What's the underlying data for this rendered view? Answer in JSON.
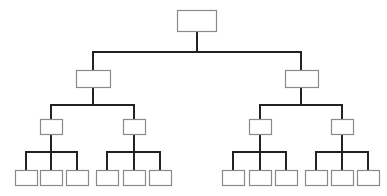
{
  "diagram": {
    "type": "hierarchy-tree",
    "levels": 4,
    "colors": {
      "line": "#222222",
      "box_border": "#8a8a8a",
      "box_fill": "#ffffff",
      "background": "#ffffff"
    },
    "nodes": [
      {
        "id": "root",
        "level": 0,
        "label": "",
        "x": 177,
        "y": 10,
        "w": 39,
        "h": 21,
        "cx": 197
      },
      {
        "id": "L1",
        "level": 1,
        "label": "",
        "parent": "root",
        "x": 76,
        "y": 70,
        "w": 34,
        "h": 17,
        "cx": 93
      },
      {
        "id": "R1",
        "level": 1,
        "label": "",
        "parent": "root",
        "x": 285,
        "y": 70,
        "w": 33,
        "h": 17,
        "cx": 301
      },
      {
        "id": "LL2",
        "level": 2,
        "label": "",
        "parent": "L1",
        "x": 40,
        "y": 119,
        "w": 22,
        "h": 15,
        "cx": 51
      },
      {
        "id": "LR2",
        "level": 2,
        "label": "",
        "parent": "L1",
        "x": 123,
        "y": 119,
        "w": 22,
        "h": 15,
        "cx": 134
      },
      {
        "id": "RL2",
        "level": 2,
        "label": "",
        "parent": "R1",
        "x": 249,
        "y": 119,
        "w": 22,
        "h": 15,
        "cx": 260
      },
      {
        "id": "RR2",
        "level": 2,
        "label": "",
        "parent": "R1",
        "x": 331,
        "y": 119,
        "w": 22,
        "h": 15,
        "cx": 342
      },
      {
        "id": "g1a",
        "level": 3,
        "label": "",
        "parent": "LL2",
        "x": 15,
        "y": 170,
        "w": 22,
        "h": 15,
        "cx": 26
      },
      {
        "id": "g1b",
        "level": 3,
        "label": "",
        "parent": "LL2",
        "x": 40,
        "y": 170,
        "w": 22,
        "h": 15,
        "cx": 51
      },
      {
        "id": "g1c",
        "level": 3,
        "label": "",
        "parent": "LL2",
        "x": 66,
        "y": 170,
        "w": 22,
        "h": 15,
        "cx": 77
      },
      {
        "id": "g2a",
        "level": 3,
        "label": "",
        "parent": "LR2",
        "x": 96,
        "y": 170,
        "w": 22,
        "h": 15,
        "cx": 107
      },
      {
        "id": "g2b",
        "level": 3,
        "label": "",
        "parent": "LR2",
        "x": 123,
        "y": 170,
        "w": 22,
        "h": 15,
        "cx": 134
      },
      {
        "id": "g2c",
        "level": 3,
        "label": "",
        "parent": "LR2",
        "x": 149,
        "y": 170,
        "w": 22,
        "h": 15,
        "cx": 160
      },
      {
        "id": "g3a",
        "level": 3,
        "label": "",
        "parent": "RL2",
        "x": 222,
        "y": 170,
        "w": 22,
        "h": 15,
        "cx": 233
      },
      {
        "id": "g3b",
        "level": 3,
        "label": "",
        "parent": "RL2",
        "x": 249,
        "y": 170,
        "w": 22,
        "h": 15,
        "cx": 260
      },
      {
        "id": "g3c",
        "level": 3,
        "label": "",
        "parent": "RL2",
        "x": 275,
        "y": 170,
        "w": 22,
        "h": 15,
        "cx": 286
      },
      {
        "id": "g4a",
        "level": 3,
        "label": "",
        "parent": "RR2",
        "x": 305,
        "y": 170,
        "w": 22,
        "h": 15,
        "cx": 316
      },
      {
        "id": "g4b",
        "level": 3,
        "label": "",
        "parent": "RR2",
        "x": 331,
        "y": 170,
        "w": 22,
        "h": 15,
        "cx": 342
      },
      {
        "id": "g4c",
        "level": 3,
        "label": "",
        "parent": "RR2",
        "x": 357,
        "y": 170,
        "w": 22,
        "h": 15,
        "cx": 368
      }
    ],
    "bus_y": {
      "root": 52,
      "L1": 105,
      "R1": 105,
      "LL2": 152,
      "LR2": 152,
      "RL2": 152,
      "RR2": 152
    }
  }
}
